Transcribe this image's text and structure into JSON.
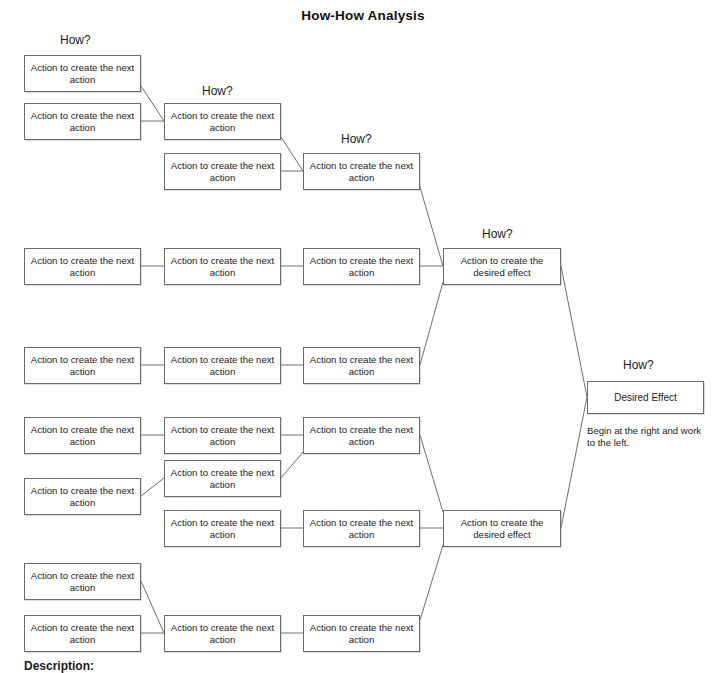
{
  "title": "How-How Analysis",
  "labels": {
    "how": "How?",
    "action_next": "Action to create the\nnext action",
    "action_desired": "Action to create the\ndesired effect",
    "desired_effect": "Desired Effect",
    "note": "Begin at the right and work to the left.",
    "description_heading": "Description:"
  },
  "how_labels": [
    {
      "text": "How?",
      "x": 60,
      "y": 33
    },
    {
      "text": "How?",
      "x": 202,
      "y": 84
    },
    {
      "text": "How?",
      "x": 341,
      "y": 132
    },
    {
      "text": "How?",
      "x": 482,
      "y": 227
    },
    {
      "text": "How?",
      "x": 623,
      "y": 358
    }
  ],
  "nodes": [
    {
      "id": "c1r1",
      "label": "Action to create the next action",
      "x": 24,
      "y": 55,
      "w": 117,
      "h": 37,
      "col": 1
    },
    {
      "id": "c1r2",
      "label": "Action to create the next action",
      "x": 24,
      "y": 103,
      "w": 117,
      "h": 37,
      "col": 1
    },
    {
      "id": "c1r3",
      "label": "Action to create the next action",
      "x": 24,
      "y": 248,
      "w": 117,
      "h": 37,
      "col": 1
    },
    {
      "id": "c1r4",
      "label": "Action to create the next action",
      "x": 24,
      "y": 347,
      "w": 117,
      "h": 37,
      "col": 1
    },
    {
      "id": "c1r5",
      "label": "Action to create the next action",
      "x": 24,
      "y": 417,
      "w": 117,
      "h": 37,
      "col": 1
    },
    {
      "id": "c1r6",
      "label": "Action to create the next action",
      "x": 24,
      "y": 478,
      "w": 117,
      "h": 37,
      "col": 1
    },
    {
      "id": "c1r7",
      "label": "Action to create the next action",
      "x": 24,
      "y": 563,
      "w": 117,
      "h": 37,
      "col": 1
    },
    {
      "id": "c1r8",
      "label": "Action to create the next action",
      "x": 24,
      "y": 615,
      "w": 117,
      "h": 37,
      "col": 1
    },
    {
      "id": "c2r1",
      "label": "Action to create the next action",
      "x": 164,
      "y": 103,
      "w": 117,
      "h": 37,
      "col": 2
    },
    {
      "id": "c2r2",
      "label": "Action to create the next action",
      "x": 164,
      "y": 153,
      "w": 117,
      "h": 37,
      "col": 2
    },
    {
      "id": "c2r3",
      "label": "Action to create the next action",
      "x": 164,
      "y": 248,
      "w": 117,
      "h": 37,
      "col": 2
    },
    {
      "id": "c2r4",
      "label": "Action to create the next action",
      "x": 164,
      "y": 347,
      "w": 117,
      "h": 37,
      "col": 2
    },
    {
      "id": "c2r5",
      "label": "Action to create the next action",
      "x": 164,
      "y": 417,
      "w": 117,
      "h": 37,
      "col": 2
    },
    {
      "id": "c2r6",
      "label": "Action to create the next action",
      "x": 164,
      "y": 460,
      "w": 117,
      "h": 37,
      "col": 2
    },
    {
      "id": "c2r7",
      "label": "Action to create the next action",
      "x": 164,
      "y": 510,
      "w": 117,
      "h": 37,
      "col": 2
    },
    {
      "id": "c2r8",
      "label": "Action to create the next action",
      "x": 164,
      "y": 615,
      "w": 117,
      "h": 37,
      "col": 2
    },
    {
      "id": "c3r1",
      "label": "Action to create the next action",
      "x": 303,
      "y": 153,
      "w": 117,
      "h": 37,
      "col": 3
    },
    {
      "id": "c3r2",
      "label": "Action to create the next action",
      "x": 303,
      "y": 248,
      "w": 117,
      "h": 37,
      "col": 3
    },
    {
      "id": "c3r3",
      "label": "Action to create the next action",
      "x": 303,
      "y": 347,
      "w": 117,
      "h": 37,
      "col": 3
    },
    {
      "id": "c3r4",
      "label": "Action to create the next action",
      "x": 303,
      "y": 417,
      "w": 117,
      "h": 37,
      "col": 3
    },
    {
      "id": "c3r5",
      "label": "Action to create the next action",
      "x": 303,
      "y": 510,
      "w": 117,
      "h": 37,
      "col": 3
    },
    {
      "id": "c3r6",
      "label": "Action to create the next action",
      "x": 303,
      "y": 615,
      "w": 117,
      "h": 37,
      "col": 3
    },
    {
      "id": "c4r1",
      "label": "Action to create the desired effect",
      "x": 443,
      "y": 248,
      "w": 118,
      "h": 37,
      "col": 4
    },
    {
      "id": "c4r2",
      "label": "Action to create the desired effect",
      "x": 443,
      "y": 510,
      "w": 118,
      "h": 37,
      "col": 4
    },
    {
      "id": "c5r1",
      "label": "Desired Effect",
      "x": 587,
      "y": 381,
      "w": 117,
      "h": 33,
      "col": 5
    }
  ],
  "links": [
    {
      "x1": 141,
      "y1": 86,
      "x2": 164,
      "y2": 121
    },
    {
      "x1": 141,
      "y1": 121,
      "x2": 164,
      "y2": 121
    },
    {
      "x1": 281,
      "y1": 137,
      "x2": 303,
      "y2": 171
    },
    {
      "x1": 281,
      "y1": 171,
      "x2": 303,
      "y2": 171
    },
    {
      "x1": 420,
      "y1": 187,
      "x2": 443,
      "y2": 266
    },
    {
      "x1": 141,
      "y1": 266,
      "x2": 164,
      "y2": 266
    },
    {
      "x1": 281,
      "y1": 266,
      "x2": 303,
      "y2": 266
    },
    {
      "x1": 420,
      "y1": 266,
      "x2": 443,
      "y2": 266
    },
    {
      "x1": 141,
      "y1": 365,
      "x2": 164,
      "y2": 365
    },
    {
      "x1": 281,
      "y1": 365,
      "x2": 303,
      "y2": 365
    },
    {
      "x1": 420,
      "y1": 365,
      "x2": 443,
      "y2": 282
    },
    {
      "x1": 561,
      "y1": 266,
      "x2": 587,
      "y2": 397
    },
    {
      "x1": 561,
      "y1": 528,
      "x2": 587,
      "y2": 397
    },
    {
      "x1": 141,
      "y1": 435,
      "x2": 164,
      "y2": 435
    },
    {
      "x1": 281,
      "y1": 435,
      "x2": 303,
      "y2": 435
    },
    {
      "x1": 141,
      "y1": 496,
      "x2": 164,
      "y2": 478
    },
    {
      "x1": 281,
      "y1": 478,
      "x2": 303,
      "y2": 452
    },
    {
      "x1": 420,
      "y1": 435,
      "x2": 443,
      "y2": 512
    },
    {
      "x1": 281,
      "y1": 528,
      "x2": 303,
      "y2": 528
    },
    {
      "x1": 420,
      "y1": 528,
      "x2": 443,
      "y2": 528
    },
    {
      "x1": 141,
      "y1": 581,
      "x2": 164,
      "y2": 633
    },
    {
      "x1": 141,
      "y1": 633,
      "x2": 164,
      "y2": 633
    },
    {
      "x1": 281,
      "y1": 633,
      "x2": 303,
      "y2": 633
    },
    {
      "x1": 420,
      "y1": 620,
      "x2": 443,
      "y2": 545
    }
  ]
}
